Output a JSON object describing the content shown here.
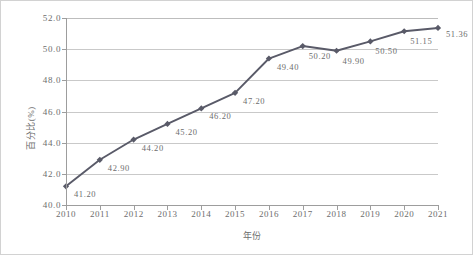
{
  "chart_data": {
    "type": "line",
    "title": "",
    "xlabel": "年份",
    "ylabel": "百分比(%)",
    "categories": [
      "2010",
      "2011",
      "2012",
      "2013",
      "2014",
      "2015",
      "2016",
      "2017",
      "2018",
      "2019",
      "2020",
      "2021"
    ],
    "values": [
      41.2,
      42.9,
      44.2,
      45.2,
      46.2,
      47.2,
      49.4,
      50.2,
      49.9,
      50.5,
      51.15,
      51.36
    ],
    "point_labels": [
      "41.20",
      "42.90",
      "44.20",
      "45.20",
      "46.20",
      "47.20",
      "49.40",
      "50.20",
      "49.90",
      "50.50",
      "51.15",
      "51.36"
    ],
    "ylim": [
      40.0,
      52.0
    ],
    "ytick_values": [
      40.0,
      42.0,
      44.0,
      46.0,
      48.0,
      50.0,
      52.0
    ],
    "ytick_labels": [
      "40.0",
      "42.0",
      "44.0",
      "46.0",
      "48.0",
      "50.0",
      "52.0"
    ],
    "grid": true,
    "legend": "none",
    "series": [
      {
        "name": "",
        "values": [
          41.2,
          42.9,
          44.2,
          45.2,
          46.2,
          47.2,
          49.4,
          50.2,
          49.9,
          50.5,
          51.15,
          51.36
        ],
        "color": "#595a68",
        "marker": "diamond"
      }
    ]
  },
  "colors": {
    "line": "#595a68",
    "marker": "#595a68",
    "gridline": "#c9c9c9",
    "axis": "#9d9d9d",
    "text": "#6d6d6d",
    "border": "#d2d2d2",
    "background": "#ffffff"
  }
}
